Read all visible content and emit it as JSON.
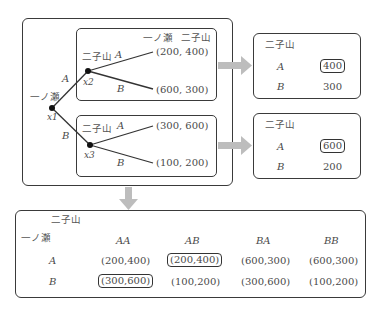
{
  "tree": {
    "players": {
      "p1": "一ノ瀬",
      "p2": "二子山"
    },
    "payoff_header": [
      "一ノ瀬",
      "二子山"
    ],
    "root": {
      "label": "一ノ瀬",
      "node": "x1",
      "branches": [
        "A",
        "B"
      ]
    },
    "upper": {
      "label": "二子山",
      "node": "x2",
      "branch_a": "A",
      "branch_b": "B",
      "payoff_a": "(200, 400)",
      "payoff_b": "(600, 300)"
    },
    "lower": {
      "label": "二子山",
      "node": "x3",
      "branch_a": "A",
      "branch_b": "B",
      "payoff_a": "(300, 600)",
      "payoff_b": "(100, 200)"
    }
  },
  "side_tables": [
    {
      "header": "二子山",
      "rows": [
        {
          "label": "A",
          "value": "400",
          "highlight": true
        },
        {
          "label": "B",
          "value": "300",
          "highlight": false
        }
      ]
    },
    {
      "header": "二子山",
      "rows": [
        {
          "label": "A",
          "value": "600",
          "highlight": true
        },
        {
          "label": "B",
          "value": "200",
          "highlight": false
        }
      ]
    }
  ],
  "matrix": {
    "col_player": "二子山",
    "row_player": "一ノ瀬",
    "columns": [
      "AA",
      "AB",
      "BA",
      "BB"
    ],
    "rows": [
      {
        "label": "A",
        "cells": [
          "(200,400)",
          "(200,400)",
          "(600,300)",
          "(600,300)"
        ],
        "highlight": [
          false,
          true,
          false,
          false
        ]
      },
      {
        "label": "B",
        "cells": [
          "(300,600)",
          "(100,200)",
          "(300,600)",
          "(100,200)"
        ],
        "highlight": [
          true,
          false,
          false,
          false
        ]
      }
    ]
  },
  "colors": {
    "line": "#333333",
    "arrow": "#bdbdbd",
    "text": "#4a4a4a"
  }
}
